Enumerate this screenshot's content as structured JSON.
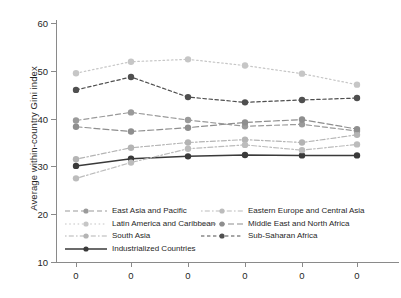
{
  "chart_data": {
    "type": "line",
    "title": "",
    "xlabel": "",
    "ylabel": "Average within-country Gini index",
    "ylim": [
      10,
      60
    ],
    "yticks": [
      10,
      20,
      30,
      40,
      50,
      60
    ],
    "ytick_labels": [
      "10",
      "20",
      "30",
      "40",
      "50",
      "60"
    ],
    "grid": false,
    "legend_position": "inside-bottom-left",
    "x": [
      1,
      2,
      3,
      4,
      5,
      6
    ],
    "xtick_labels": [
      "0",
      "0",
      "0",
      "0",
      "0",
      "0"
    ],
    "categories": [
      "0",
      "0",
      "0",
      "0",
      "0",
      "0"
    ],
    "series": [
      {
        "name": "East Asia and Pacific",
        "values": [
          39.6,
          41.3,
          39.7,
          38.4,
          38.8,
          37.4
        ],
        "color": "#9a9a9a",
        "dash": "5,3",
        "marker": "circle"
      },
      {
        "name": "Latin America and Caribbean",
        "values": [
          49.5,
          51.9,
          52.4,
          51.1,
          49.4,
          47.1
        ],
        "color": "#c6c6c6",
        "dash": "1.6,2.6",
        "marker": "circle"
      },
      {
        "name": "South Asia",
        "values": [
          31.5,
          33.9,
          35.0,
          35.6,
          35.0,
          36.6
        ],
        "color": "#b4b4b4",
        "dash": "1.6,2.2,5,2.2",
        "marker": "circle"
      },
      {
        "name": "Industrialized Countries",
        "values": [
          30.1,
          31.6,
          32.1,
          32.4,
          32.3,
          32.3
        ],
        "color": "#3a3a3a",
        "dash": "none",
        "marker": "circle"
      },
      {
        "name": "Eastern Europe and Central Asia",
        "values": [
          27.5,
          30.8,
          33.7,
          34.5,
          33.4,
          34.6
        ],
        "color": "#bcbcbc",
        "dash": "1.6,2.2,5,2.2",
        "marker": "circle"
      },
      {
        "name": "Middle East and North Africa",
        "values": [
          38.3,
          37.3,
          38.1,
          39.2,
          39.8,
          37.8
        ],
        "color": "#8e8e8e",
        "dash": "6,3",
        "marker": "circle"
      },
      {
        "name": "Sub-Saharan Africa",
        "values": [
          46.0,
          48.7,
          44.5,
          43.4,
          43.9,
          44.3
        ],
        "color": "#4f4f4f",
        "dash": "3.4,2.6",
        "marker": "circle"
      }
    ],
    "legend_columns": [
      [
        "East Asia and Pacific",
        "Latin America and Caribbean",
        "South Asia",
        "Industrialized Countries"
      ],
      [
        "Eastern Europe and Central Asia",
        "Middle East and North Africa",
        "Sub-Saharan Africa"
      ]
    ]
  }
}
